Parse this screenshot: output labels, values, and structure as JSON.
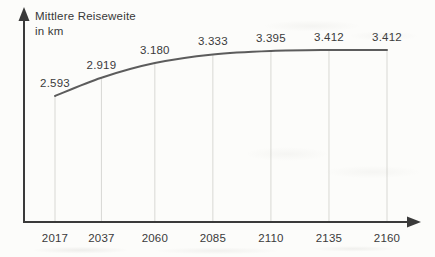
{
  "figure": {
    "ylabel_line1": "Mittlere Reiseweite",
    "ylabel_line2": "in km"
  },
  "chart_data": {
    "type": "line",
    "title": "Mittlere Reiseweite in km",
    "ylabel": "Mittlere Reiseweite in km",
    "xlabel": "",
    "categories": [
      "2017",
      "2037",
      "2060",
      "2085",
      "2110",
      "2135",
      "2160"
    ],
    "values": [
      2593,
      2919,
      3180,
      3333,
      3395,
      3412,
      3412
    ],
    "value_labels": [
      "2.593",
      "2.919",
      "3.180",
      "3.333",
      "3.395",
      "3.412",
      "3.412"
    ],
    "value_format_note": "German thousands notation, km",
    "y_axis_ticks": "none",
    "grid": "vertical guide lines from x-axis up to the curve",
    "legend": "none"
  },
  "colors": {
    "axis": "#3a3a3a",
    "curve": "#5c5c5c",
    "gridline": "#d8d8d4",
    "text": "#3a3a3a",
    "background": "#fcfcfa"
  }
}
